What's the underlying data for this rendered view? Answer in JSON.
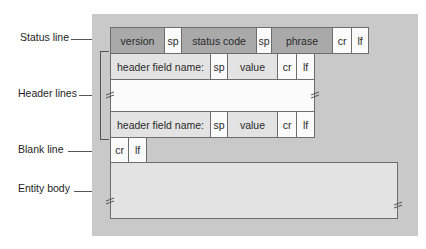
{
  "labels": {
    "status_line": "Status line",
    "header_lines": "Header lines",
    "blank_line": "Blank line",
    "entity_body": "Entity body"
  },
  "status_line": {
    "version": "version",
    "sp1": "sp",
    "status_code": "status code",
    "sp2": "sp",
    "phrase": "phrase",
    "cr": "cr",
    "lf": "lf"
  },
  "header_line_1": {
    "field_name": "header field name:",
    "sp": "sp",
    "value": "value",
    "cr": "cr",
    "lf": "lf"
  },
  "header_line_2": {
    "field_name": "header field name:",
    "sp": "sp",
    "value": "value",
    "cr": "cr",
    "lf": "lf"
  },
  "blank_line": {
    "cr": "cr",
    "lf": "lf"
  },
  "colors": {
    "panel": "#c9c9c9",
    "dark_cell": "#a9a9a9",
    "light_cell": "#e3e3e3",
    "white_cell": "#fbfbfb"
  }
}
